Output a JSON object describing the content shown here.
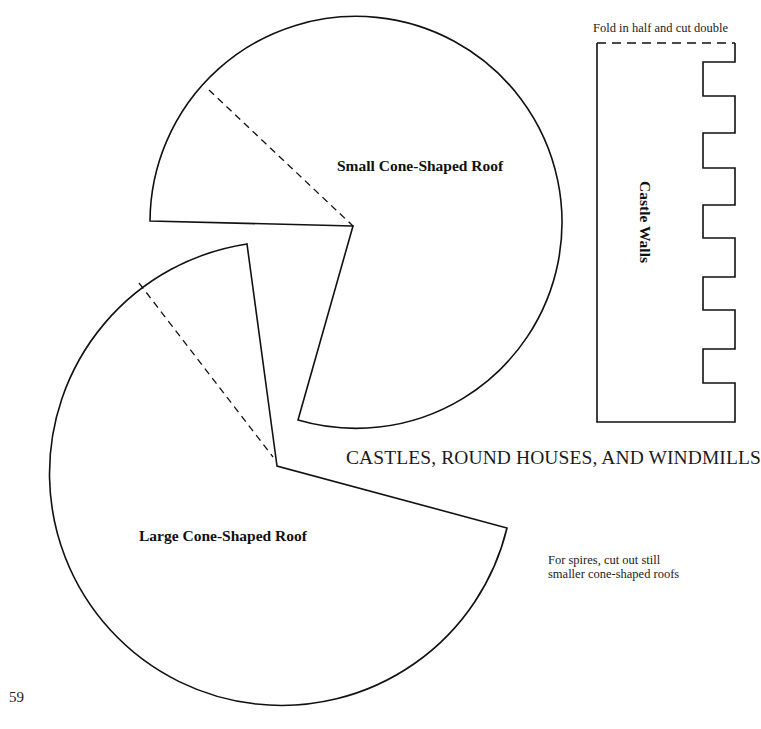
{
  "page": {
    "number": "59",
    "title": "CASTLES, ROUND HOUSES, AND WINDMILLS"
  },
  "templates": {
    "small_cone": {
      "label": "Small Cone-Shaped Roof"
    },
    "large_cone": {
      "label": "Large Cone-Shaped Roof"
    },
    "castle_walls": {
      "label": "Castle Walls",
      "instruction": "Fold in half and cut double"
    }
  },
  "notes": {
    "spires_line1": "For spires, cut out still",
    "spires_line2": "smaller cone-shaped roofs"
  },
  "colors": {
    "line": "#111111",
    "background": "#ffffff"
  }
}
